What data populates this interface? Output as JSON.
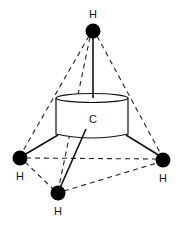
{
  "diagram": {
    "colors": {
      "atom": "#000000",
      "line": "#111111",
      "background": "#ffffff"
    },
    "central_atom": {
      "label": "C",
      "shape": "cylinder"
    },
    "atoms": [
      {
        "id": "h_top",
        "label": "H",
        "position": "top"
      },
      {
        "id": "h_left",
        "label": "H",
        "position": "left"
      },
      {
        "id": "h_right",
        "label": "H",
        "position": "right"
      },
      {
        "id": "h_front",
        "label": "H",
        "position": "front"
      }
    ],
    "bonds": [
      {
        "from": "C",
        "to": "h_top",
        "style": "solid"
      },
      {
        "from": "C",
        "to": "h_left",
        "style": "solid"
      },
      {
        "from": "C",
        "to": "h_right",
        "style": "solid"
      },
      {
        "from": "C",
        "to": "h_front",
        "style": "solid"
      }
    ],
    "edges": [
      {
        "from": "h_top",
        "to": "h_left",
        "style": "dashed"
      },
      {
        "from": "h_top",
        "to": "h_right",
        "style": "dashed"
      },
      {
        "from": "h_top",
        "to": "h_front",
        "style": "dashed"
      },
      {
        "from": "h_left",
        "to": "h_right",
        "style": "dashed"
      },
      {
        "from": "h_left",
        "to": "h_front",
        "style": "dashed"
      },
      {
        "from": "h_front",
        "to": "h_right",
        "style": "dashed"
      }
    ]
  }
}
